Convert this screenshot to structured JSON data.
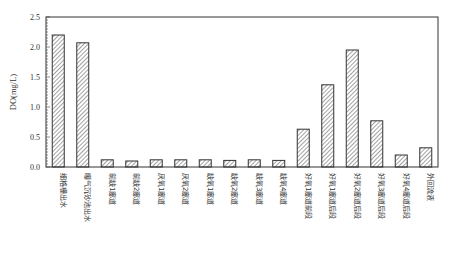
{
  "chart_data": {
    "type": "bar",
    "title": "",
    "xlabel": "",
    "ylabel": "DO(mg/L)",
    "ylim": [
      0,
      2.5
    ],
    "yticks": [
      "0.0",
      "0.5",
      "1.0",
      "1.5",
      "2.0",
      "2.5"
    ],
    "grid": false,
    "legend": null,
    "bar_style": "diagonal-hatch",
    "categories": [
      "细格栅出水",
      "曝气沉砂池出水",
      "前缺1廊道",
      "前缺2廊道",
      "厌氧1廊道",
      "厌氧2廊道",
      "缺氧1廊道",
      "缺氧2廊道",
      "缺氧3廊道",
      "缺氧4廊道",
      "好氧1廊道前段",
      "好氧1廊道后段",
      "好氧2廊道后段",
      "好氧3廊道后段",
      "好氧4廊道后段",
      "外回流液"
    ],
    "values": [
      2.2,
      2.07,
      0.12,
      0.1,
      0.12,
      0.12,
      0.12,
      0.11,
      0.12,
      0.11,
      0.63,
      1.37,
      1.95,
      0.77,
      0.2,
      0.32
    ]
  }
}
